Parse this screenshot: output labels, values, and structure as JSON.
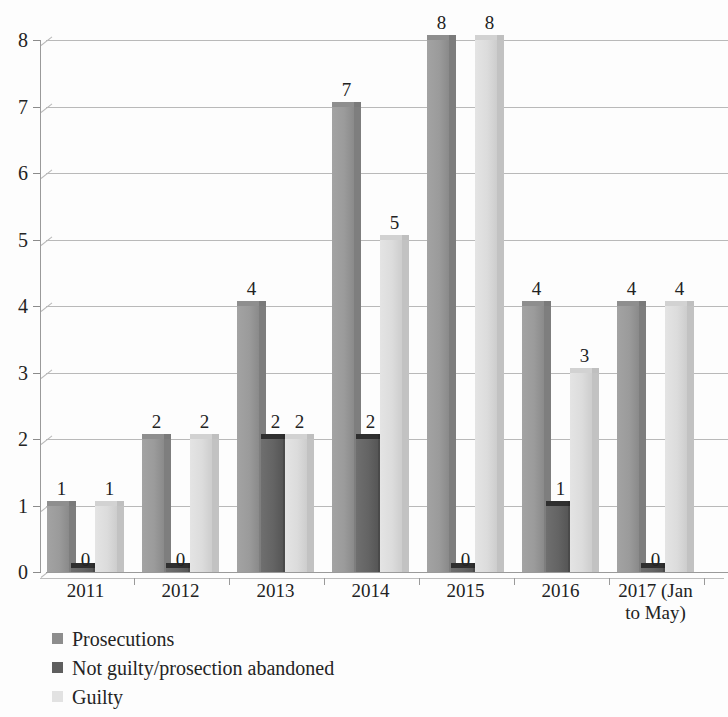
{
  "chart_data": {
    "type": "bar",
    "title": "",
    "subtitle": "",
    "xlabel": "",
    "ylabel": "",
    "ylim": [
      0,
      8
    ],
    "y_ticks": [
      0,
      1,
      2,
      3,
      4,
      5,
      6,
      7,
      8
    ],
    "grid": true,
    "legend_position": "bottom-left",
    "style": "3d-clustered-column",
    "categories": [
      "2011",
      "2012",
      "2013",
      "2014",
      "2015",
      "2016",
      "2017 (Jan to May)"
    ],
    "category_labels_display": [
      "2011",
      "2012",
      "2013",
      "2014",
      "2015",
      "2016",
      "2017 (Jan\nto May)"
    ],
    "series": [
      {
        "name": "Prosecutions",
        "color": "#8d8d8d",
        "values": [
          1,
          2,
          4,
          7,
          8,
          4,
          4
        ]
      },
      {
        "name": "Not guilty/prosection abandoned",
        "color": "#5e5e5e",
        "values": [
          0,
          0,
          2,
          2,
          0,
          1,
          0
        ]
      },
      {
        "name": "Guilty",
        "color": "#e2e2e2",
        "values": [
          1,
          2,
          2,
          5,
          8,
          3,
          4
        ]
      }
    ],
    "data_labels": [
      {
        "category": "2011",
        "series": "Prosecutions",
        "value": 1
      },
      {
        "category": "2011",
        "series": "Not guilty/prosection abandoned",
        "value": 0
      },
      {
        "category": "2011",
        "series": "Guilty",
        "value": 1
      },
      {
        "category": "2012",
        "series": "Prosecutions",
        "value": 2
      },
      {
        "category": "2012",
        "series": "Not guilty/prosection abandoned",
        "value": 0
      },
      {
        "category": "2012",
        "series": "Guilty",
        "value": 2
      },
      {
        "category": "2013",
        "series": "Prosecutions",
        "value": 4
      },
      {
        "category": "2013",
        "series": "Not guilty/prosection abandoned",
        "value": 2
      },
      {
        "category": "2013",
        "series": "Guilty",
        "value": 2
      },
      {
        "category": "2014",
        "series": "Prosecutions",
        "value": 7
      },
      {
        "category": "2014",
        "series": "Not guilty/prosection abandoned",
        "value": 2
      },
      {
        "category": "2014",
        "series": "Guilty",
        "value": 5
      },
      {
        "category": "2015",
        "series": "Prosecutions",
        "value": 8
      },
      {
        "category": "2015",
        "series": "Not guilty/prosection abandoned",
        "value": 0
      },
      {
        "category": "2015",
        "series": "Guilty",
        "value": 8
      },
      {
        "category": "2016",
        "series": "Prosecutions",
        "value": 4
      },
      {
        "category": "2016",
        "series": "Not guilty/prosection abandoned",
        "value": 1
      },
      {
        "category": "2016",
        "series": "Guilty",
        "value": 3
      },
      {
        "category": "2017 (Jan to May)",
        "series": "Prosecutions",
        "value": 4
      },
      {
        "category": "2017 (Jan to May)",
        "series": "Not guilty/prosection abandoned",
        "value": 0
      },
      {
        "category": "2017 (Jan to May)",
        "series": "Guilty",
        "value": 4
      }
    ]
  },
  "axis": {
    "y_ticks": [
      "0",
      "1",
      "2",
      "3",
      "4",
      "5",
      "6",
      "7",
      "8"
    ],
    "x_labels": [
      {
        "line1": "2011",
        "line2": ""
      },
      {
        "line1": "2012",
        "line2": ""
      },
      {
        "line1": "2013",
        "line2": ""
      },
      {
        "line1": "2014",
        "line2": ""
      },
      {
        "line1": "2015",
        "line2": ""
      },
      {
        "line1": "2016",
        "line2": ""
      },
      {
        "line1": "2017 (Jan",
        "line2": "to May)"
      }
    ]
  },
  "legend": {
    "items": [
      {
        "label": "Prosecutions",
        "swatch": "#8d8d8d"
      },
      {
        "label": "Not guilty/prosection abandoned",
        "swatch": "#5e5e5e"
      },
      {
        "label": "Guilty",
        "swatch": "#e2e2e2"
      }
    ]
  }
}
